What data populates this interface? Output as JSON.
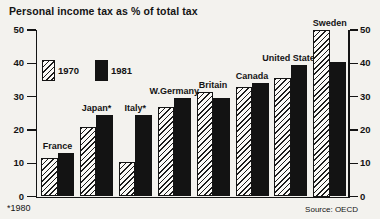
{
  "title": "Personal income tax as % of total tax",
  "footnote": "*1980",
  "source": "Source: OECD",
  "colors": {
    "ink": "#141414",
    "paper": "#f3f2ee"
  },
  "legend": [
    {
      "label": "1970",
      "style": "hatched"
    },
    {
      "label": "1981",
      "style": "solid"
    }
  ],
  "chart_data": {
    "type": "bar",
    "title": "Personal income tax as % of total tax",
    "categories": [
      "France",
      "Japan*",
      "Italy*",
      "W.Germany",
      "Britain",
      "Canada",
      "United States",
      "Sweden"
    ],
    "series": [
      {
        "name": "1970",
        "values": [
          11.5,
          21,
          10.5,
          27,
          31.5,
          33,
          35.5,
          50
        ]
      },
      {
        "name": "1981",
        "values": [
          13,
          24.5,
          24.5,
          29.5,
          29.5,
          34,
          39.5,
          40.5
        ]
      }
    ],
    "ylim": [
      0,
      50
    ],
    "ytick_step": 10,
    "yticks": [
      0,
      10,
      20,
      30,
      40,
      50
    ],
    "axis_labels_both_sides": true,
    "legend_position": "top-left",
    "grid": false,
    "footnote": "*1980",
    "source": "Source: OECD"
  }
}
